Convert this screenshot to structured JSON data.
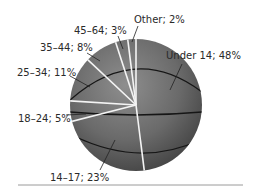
{
  "chart_data": {
    "type": "pie",
    "title": "",
    "categories": [
      "Under 14",
      "14–17",
      "18–24",
      "25–34",
      "35–44",
      "45–64",
      "Other"
    ],
    "values": [
      48,
      23,
      5,
      11,
      8,
      3,
      2
    ],
    "unit": "%",
    "labels": [
      "Under 14; 48%",
      "14–17; 23%",
      "18–24; 5%",
      "25–34; 11%",
      "35–44; 8%",
      "45–64; 3%",
      "Other; 2%"
    ],
    "style": "basketball-textured pie",
    "legend": "none (direct labels with leader lines)"
  },
  "colors": {
    "ball": "#6b6b6b",
    "ball_highlight": "#8c8c8c",
    "ball_shadow": "#3a3a3a",
    "slice_divider": "#f4f4f4",
    "seam": "#1a1a1a",
    "label_text": "#2a2a2a",
    "rule": "#9a9a9a"
  }
}
